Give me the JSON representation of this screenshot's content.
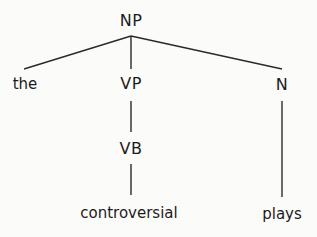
{
  "diagram": {
    "type": "syntax-tree",
    "root": "NP",
    "nodes": [
      {
        "id": "np",
        "label": "NP",
        "kind": "category"
      },
      {
        "id": "the",
        "label": "the",
        "kind": "word"
      },
      {
        "id": "vp",
        "label": "VP",
        "kind": "category"
      },
      {
        "id": "n",
        "label": "N",
        "kind": "category"
      },
      {
        "id": "vb",
        "label": "VB",
        "kind": "category"
      },
      {
        "id": "controversial",
        "label": "controversial",
        "kind": "word"
      },
      {
        "id": "plays",
        "label": "plays",
        "kind": "word"
      }
    ],
    "edges": [
      {
        "from": "NP",
        "to": "the"
      },
      {
        "from": "NP",
        "to": "VP"
      },
      {
        "from": "NP",
        "to": "N"
      },
      {
        "from": "VP",
        "to": "VB"
      },
      {
        "from": "VB",
        "to": "controversial"
      },
      {
        "from": "N",
        "to": "plays"
      }
    ],
    "colors": {
      "background": "#fbfbf9",
      "text": "#1c1c1c",
      "line": "#2a2a2a"
    }
  }
}
